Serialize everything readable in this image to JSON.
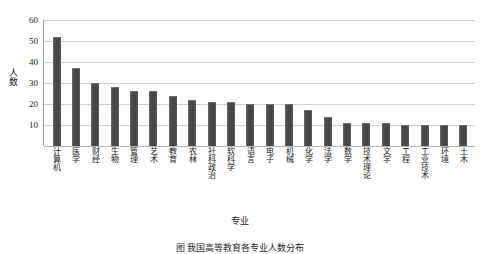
{
  "chart_data": {
    "type": "bar",
    "title": "",
    "xlabel": "专业",
    "ylabel": "人数",
    "ylim": [
      0,
      60
    ],
    "yticks": [
      0,
      10,
      20,
      30,
      40,
      50,
      60
    ],
    "grid": true,
    "legend": null,
    "bar_color": "#4b4b4b",
    "categories": [
      "计算机",
      "医学",
      "财经",
      "生物",
      "管理",
      "艺术",
      "教育",
      "农林",
      "社科政治",
      "软科学",
      "语言",
      "电子",
      "机械",
      "化学",
      "法学",
      "数学",
      "技术理论",
      "文学",
      "工程",
      "工业技术",
      "环境",
      "土木"
    ],
    "values": [
      52,
      37,
      30,
      28,
      26,
      26,
      24,
      22,
      21,
      21,
      20,
      20,
      20,
      17,
      14,
      11,
      11,
      11,
      10,
      10,
      10,
      10
    ]
  },
  "caption": {
    "text": "图  我国高等教育各专业人数分布"
  }
}
